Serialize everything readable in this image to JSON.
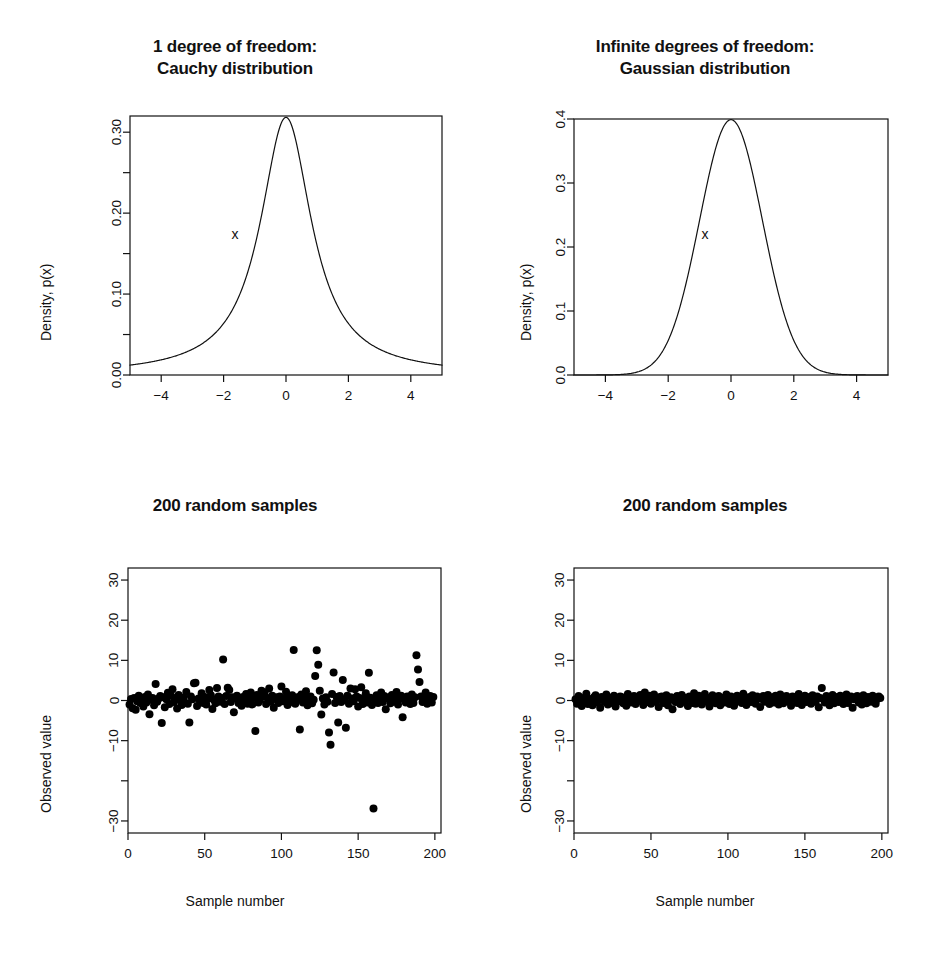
{
  "figure": {
    "background": "#ffffff",
    "foreground": "#111111",
    "width": 940,
    "height": 970,
    "layout": "2x2 grid of R base-graphics panels"
  },
  "panels": [
    {
      "id": "cauchy-density",
      "title_line1": "1 degree of freedom:",
      "title_line2": "Cauchy distribution",
      "xlabel": "x",
      "ylabel": "Density, p(x)"
    },
    {
      "id": "gaussian-density",
      "title_line1": "Infinite degrees of freedom:",
      "title_line2": "Gaussian distribution",
      "xlabel": "x",
      "ylabel": "Density, p(x)"
    },
    {
      "id": "cauchy-samples",
      "title_line1": "200 random samples",
      "title_line2": "",
      "xlabel": "Sample number",
      "ylabel": "Observed value"
    },
    {
      "id": "gaussian-samples",
      "title_line1": "200 random samples",
      "title_line2": "",
      "xlabel": "Sample number",
      "ylabel": "Observed value"
    }
  ],
  "chart_data": [
    {
      "type": "line",
      "id": "cauchy-density",
      "title": "1 degree of freedom: Cauchy distribution",
      "xlabel": "x",
      "ylabel": "Density, p(x)",
      "xlim": [
        -5,
        5
      ],
      "ylim": [
        0,
        0.32
      ],
      "grid": false,
      "legend": "none",
      "xticks": [
        -4,
        -2,
        0,
        2,
        4
      ],
      "xtick_labels": [
        "−4",
        "−2",
        "0",
        "2",
        "4"
      ],
      "yticks": [
        0.0,
        0.05,
        0.1,
        0.15,
        0.2,
        0.25,
        0.3
      ],
      "ytick_labels": [
        "0.00",
        "",
        "0.10",
        "",
        "0.20",
        "",
        "0.30"
      ],
      "series": [
        {
          "name": "Cauchy density (t, df=1)",
          "formula": "1/(pi*(1+x^2))",
          "x": [
            -5.0,
            -4.75,
            -4.5,
            -4.25,
            -4.0,
            -3.75,
            -3.5,
            -3.25,
            -3.0,
            -2.75,
            -2.5,
            -2.25,
            -2.0,
            -1.75,
            -1.5,
            -1.25,
            -1.0,
            -0.875,
            -0.75,
            -0.625,
            -0.5,
            -0.375,
            -0.25,
            -0.125,
            0.0,
            0.125,
            0.25,
            0.375,
            0.5,
            0.625,
            0.75,
            0.875,
            1.0,
            1.25,
            1.5,
            1.75,
            2.0,
            2.25,
            2.5,
            2.75,
            3.0,
            3.25,
            3.5,
            3.75,
            4.0,
            4.25,
            4.5,
            4.75,
            5.0
          ],
          "y": [
            0.0122,
            0.0135,
            0.0151,
            0.0168,
            0.0187,
            0.0211,
            0.0239,
            0.0273,
            0.0318,
            0.0374,
            0.0439,
            0.0523,
            0.0637,
            0.0785,
            0.098,
            0.1224,
            0.1592,
            0.1815,
            0.2037,
            0.2292,
            0.2546,
            0.2793,
            0.2995,
            0.3137,
            0.3183,
            0.3137,
            0.2995,
            0.2793,
            0.2546,
            0.2292,
            0.2037,
            0.1815,
            0.1592,
            0.1224,
            0.098,
            0.0785,
            0.0637,
            0.0523,
            0.0439,
            0.0374,
            0.0318,
            0.0273,
            0.0239,
            0.0211,
            0.0187,
            0.0168,
            0.0151,
            0.0135,
            0.0122
          ]
        }
      ]
    },
    {
      "type": "line",
      "id": "gaussian-density",
      "title": "Infinite degrees of freedom: Gaussian distribution",
      "xlabel": "x",
      "ylabel": "Density, p(x)",
      "xlim": [
        -5,
        5
      ],
      "ylim": [
        0,
        0.4
      ],
      "grid": false,
      "legend": "none",
      "xticks": [
        -4,
        -2,
        0,
        2,
        4
      ],
      "xtick_labels": [
        "−4",
        "−2",
        "0",
        "2",
        "4"
      ],
      "yticks": [
        0.0,
        0.1,
        0.2,
        0.3,
        0.4
      ],
      "ytick_labels": [
        "0.0",
        "0.1",
        "0.2",
        "0.3",
        "0.4"
      ],
      "series": [
        {
          "name": "Gaussian density (normal, mean 0, sd 1)",
          "formula": "exp(-x^2/2)/sqrt(2*pi)",
          "x": [
            -5.0,
            -4.75,
            -4.5,
            -4.25,
            -4.0,
            -3.75,
            -3.5,
            -3.25,
            -3.0,
            -2.75,
            -2.5,
            -2.25,
            -2.0,
            -1.75,
            -1.5,
            -1.25,
            -1.0,
            -0.75,
            -0.5,
            -0.25,
            0.0,
            0.25,
            0.5,
            0.75,
            1.0,
            1.25,
            1.5,
            1.75,
            2.0,
            2.25,
            2.5,
            2.75,
            3.0,
            3.25,
            3.5,
            3.75,
            4.0,
            4.25,
            4.5,
            4.75,
            5.0
          ],
          "y": [
            1.5e-06,
            5.2e-06,
            1.6e-05,
            4.46e-05,
            0.0001338,
            0.000337,
            0.0008727,
            0.0020374,
            0.0044318,
            0.0090937,
            0.0175283,
            0.031652,
            0.053991,
            0.0862773,
            0.1295176,
            0.1826491,
            0.2419707,
            0.3011374,
            0.3520653,
            0.3866681,
            0.3989423,
            0.3866681,
            0.3520653,
            0.3011374,
            0.2419707,
            0.1826491,
            0.1295176,
            0.0862773,
            0.053991,
            0.031652,
            0.0175283,
            0.0090937,
            0.0044318,
            0.0020374,
            0.0008727,
            0.000337,
            0.0001338,
            4.46e-05,
            1.6e-05,
            5.2e-06,
            1.5e-06
          ]
        }
      ]
    },
    {
      "type": "scatter",
      "id": "cauchy-samples",
      "title": "200 random samples",
      "xlabel": "Sample number",
      "ylabel": "Observed value",
      "xlim": [
        0,
        204
      ],
      "ylim": [
        -33,
        33
      ],
      "grid": false,
      "legend": "none",
      "n": 200,
      "xticks": [
        0,
        50,
        100,
        150,
        200
      ],
      "xtick_labels": [
        "0",
        "50",
        "100",
        "150",
        "200"
      ],
      "yticks": [
        -30,
        -20,
        -10,
        0,
        10,
        20,
        30
      ],
      "ytick_labels": [
        "−30",
        "",
        "−10",
        "0",
        "10",
        "20",
        "30"
      ],
      "distribution": "Cauchy (t with 1 degree of freedom), heavy-tailed",
      "point_style": {
        "marker": "filled-circle",
        "color": "#000000",
        "radius_px": 4
      },
      "values": [
        -1.0,
        0.4,
        -1.9,
        0.6,
        -2.3,
        -0.2,
        1.2,
        -0.6,
        0.1,
        -1.5,
        0.9,
        -0.5,
        1.5,
        -3.4,
        0.2,
        0.6,
        -1.2,
        4.1,
        -0.3,
        0.5,
        1.1,
        -5.6,
        0.8,
        -1.7,
        0.3,
        1.9,
        -0.9,
        1.2,
        2.8,
        -0.4,
        0.6,
        -2.0,
        1.4,
        0.2,
        -1.1,
        0.7,
        -0.5,
        2.1,
        -0.8,
        -5.5,
        1.0,
        0.3,
        4.3,
        4.4,
        -1.4,
        0.5,
        -0.2,
        1.8,
        -0.6,
        0.9,
        -1.0,
        0.4,
        2.6,
        1.3,
        -2.1,
        0.2,
        -0.7,
        3.1,
        1.0,
        -0.3,
        0.6,
        10.2,
        -0.9,
        1.1,
        3.2,
        2.6,
        -0.4,
        0.8,
        -2.9,
        0.5,
        1.2,
        -0.6,
        0.3,
        -1.3,
        0.9,
        -0.2,
        1.6,
        -0.8,
        0.4,
        2.0,
        -1.0,
        0.7,
        -7.6,
        1.4,
        -0.5,
        0.2,
        2.4,
        1.1,
        2.0,
        -0.9,
        0.6,
        3.0,
        -0.3,
        1.2,
        -1.8,
        0.4,
        0.8,
        -0.6,
        1.0,
        3.5,
        -0.2,
        0.5,
        2.2,
        -1.1,
        0.7,
        -0.4,
        1.3,
        12.6,
        -0.8,
        0.3,
        0.9,
        -7.2,
        1.5,
        -0.5,
        0.6,
        2.3,
        -1.2,
        0.4,
        1.0,
        -0.7,
        0.2,
        6.1,
        12.5,
        8.9,
        2.4,
        -3.5,
        0.5,
        -1.0,
        0.8,
        -0.3,
        -8.0,
        -11.0,
        1.6,
        7.0,
        -0.6,
        0.9,
        -5.5,
        1.1,
        -0.4,
        5.1,
        0.3,
        -6.8,
        1.2,
        -0.8,
        3.0,
        0.5,
        -0.2,
        2.8,
        1.0,
        -1.5,
        0.6,
        3.3,
        -0.9,
        0.4,
        1.8,
        -0.5,
        6.9,
        0.7,
        -1.1,
        -26.9,
        0.3,
        1.3,
        -0.6,
        0.9,
        2.0,
        -0.4,
        1.1,
        -2.2,
        0.5,
        0.8,
        -0.7,
        1.4,
        -0.3,
        0.6,
        2.1,
        -1.0,
        0.4,
        1.2,
        -4.2,
        0.7,
        -0.5,
        1.0,
        0.2,
        -0.9,
        1.5,
        -0.6,
        0.8,
        11.3,
        7.7,
        4.6,
        1.0,
        -0.4,
        0.6,
        2.0,
        -0.8,
        0.3,
        1.1,
        -0.5,
        0.9
      ]
    },
    {
      "type": "scatter",
      "id": "gaussian-samples",
      "title": "200 random samples",
      "xlabel": "Sample number",
      "ylabel": "Observed value",
      "xlim": [
        0,
        204
      ],
      "ylim": [
        -33,
        33
      ],
      "grid": false,
      "legend": "none",
      "n": 200,
      "xticks": [
        0,
        50,
        100,
        150,
        200
      ],
      "xtick_labels": [
        "0",
        "50",
        "100",
        "150",
        "200"
      ],
      "yticks": [
        -30,
        -20,
        -10,
        0,
        10,
        20,
        30
      ],
      "ytick_labels": [
        "−30",
        "",
        "−10",
        "0",
        "10",
        "20",
        "30"
      ],
      "distribution": "Gaussian (normal, mean 0, sd 1), light-tailed",
      "point_style": {
        "marker": "filled-circle",
        "color": "#000000",
        "radius_px": 4
      },
      "values": [
        0.3,
        -0.8,
        1.1,
        0.2,
        -1.4,
        0.6,
        -0.3,
        1.7,
        -0.9,
        0.4,
        0.1,
        -1.2,
        0.8,
        1.3,
        -0.5,
        0.2,
        -1.8,
        0.9,
        0.6,
        -0.4,
        1.5,
        -1.0,
        0.3,
        0.7,
        -0.6,
        1.2,
        -1.5,
        0.5,
        -0.2,
        1.0,
        0.8,
        -0.7,
        0.4,
        -1.3,
        1.6,
        0.1,
        -0.5,
        0.9,
        1.1,
        -0.9,
        0.3,
        -0.1,
        1.4,
        0.6,
        -1.1,
        2.0,
        0.5,
        -0.4,
        1.2,
        -0.8,
        0.7,
        1.5,
        -0.3,
        0.2,
        -1.6,
        0.9,
        1.0,
        -0.6,
        0.4,
        1.3,
        -1.2,
        0.1,
        0.8,
        -2.2,
        0.5,
        -0.4,
        1.1,
        0.6,
        -0.9,
        1.4,
        0.3,
        -0.2,
        0.7,
        -1.4,
        1.0,
        0.4,
        -0.6,
        1.8,
        -0.8,
        0.2,
        1.2,
        0.5,
        -1.0,
        0.9,
        1.6,
        -0.3,
        0.6,
        -1.5,
        0.1,
        1.3,
        0.8,
        -0.7,
        0.4,
        1.1,
        -1.2,
        0.3,
        0.7,
        -0.5,
        1.5,
        0.2,
        -0.9,
        1.0,
        0.6,
        -1.3,
        0.4,
        1.2,
        -0.2,
        0.8,
        -0.6,
        1.7,
        0.3,
        -1.1,
        0.5,
        0.9,
        -0.4,
        1.3,
        0.1,
        -0.8,
        1.0,
        0.6,
        -1.6,
        0.4,
        1.1,
        -0.3,
        0.7,
        1.4,
        -0.9,
        0.2,
        0.8,
        -0.5,
        1.2,
        0.5,
        -1.0,
        1.5,
        0.3,
        -0.7,
        0.9,
        1.1,
        -0.2,
        0.6,
        -1.3,
        1.0,
        0.4,
        0.8,
        -0.6,
        1.6,
        0.2,
        -1.1,
        0.7,
        1.2,
        -0.4,
        0.5,
        0.9,
        -0.8,
        1.3,
        0.1,
        -0.3,
        1.0,
        -1.7,
        0.6,
        3.1,
        0.4,
        -0.5,
        1.1,
        0.8,
        -1.2,
        0.3,
        1.4,
        -0.7,
        0.5,
        0.9,
        -0.4,
        1.2,
        0.2,
        -0.9,
        0.7,
        1.5,
        -0.6,
        0.4,
        1.0,
        -1.8,
        0.3,
        0.8,
        1.1,
        -0.5,
        0.6,
        -1.0,
        1.3,
        0.2,
        -0.7,
        0.9,
        0.5,
        -0.3,
        1.2,
        0.7,
        -0.8,
        0.4,
        1.0,
        0.6
      ]
    }
  ]
}
